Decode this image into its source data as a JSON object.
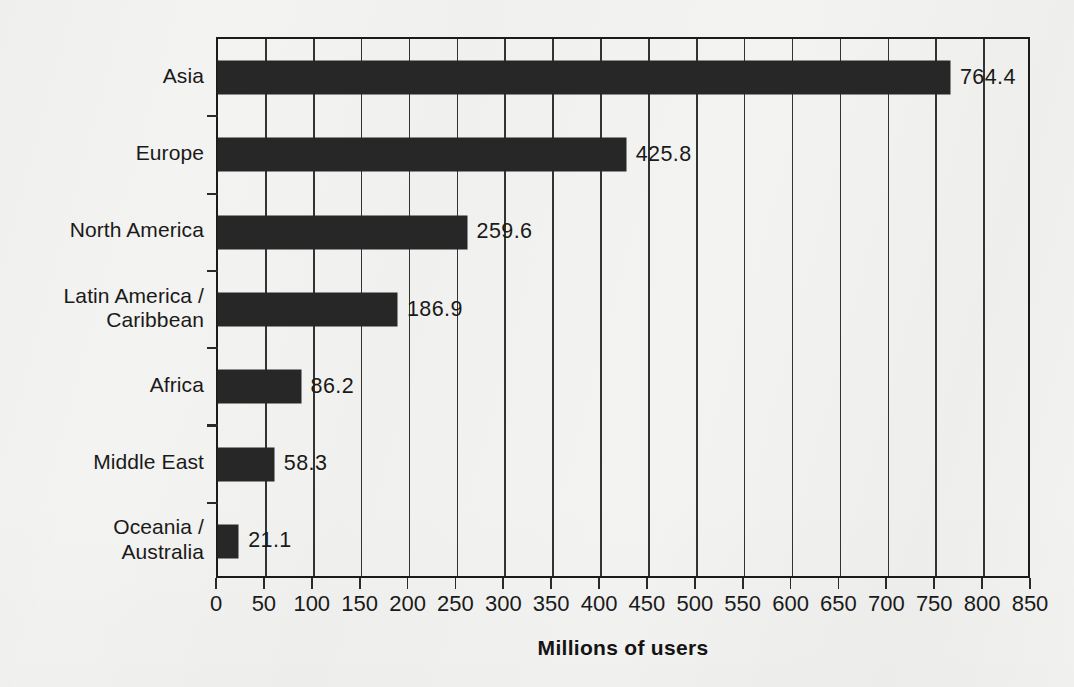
{
  "chart_data": {
    "type": "bar",
    "orientation": "horizontal",
    "title": "",
    "xlabel": "Millions of users",
    "ylabel": "",
    "categories": [
      "Asia",
      "Europe",
      "North America",
      "Latin America /\nCaribbean",
      "Africa",
      "Middle East",
      "Oceania /\nAustralia"
    ],
    "values": [
      764.4,
      425.8,
      259.6,
      186.9,
      86.2,
      58.3,
      21.1
    ],
    "value_labels": [
      "764.4",
      "425.8",
      "259.6",
      "186.9",
      "86.2",
      "58.3",
      "21.1"
    ],
    "xlim": [
      0,
      850
    ],
    "xticks": [
      0,
      50,
      100,
      150,
      200,
      250,
      300,
      350,
      400,
      450,
      500,
      550,
      600,
      650,
      700,
      750,
      800,
      850
    ],
    "xtick_labels": [
      "0",
      "50",
      "100",
      "150",
      "200",
      "250",
      "300",
      "350",
      "400",
      "450",
      "500",
      "550",
      "600",
      "650",
      "700",
      "750",
      "800",
      "850"
    ],
    "grid": "vertical",
    "legend": "none",
    "bar_color": "#272727",
    "axis_color": "#1b1b1b",
    "background_color": "#f3f3f1",
    "text_color": "#1a1a1a"
  }
}
